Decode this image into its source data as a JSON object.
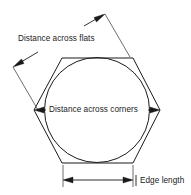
{
  "diagram": {
    "canvas": {
      "width": 191,
      "height": 195,
      "background": "#ffffff"
    },
    "stroke_color": "#1a1a1a",
    "extension_line_color": "#4a4a4a",
    "labels": {
      "distance_across_flats": "Distance across flats",
      "distance_across_corners": "Distance across corners",
      "edge_length": "Edge length"
    },
    "shapes": {
      "hexagon": {
        "name": "hexagon-outline",
        "orientation": "flat-top",
        "center": [
          97,
          110
        ],
        "circumradius": 63,
        "points": "62,58 133,58 160,110 133,163 62,163 34,110"
      },
      "circle": {
        "name": "chamfer-circle",
        "center": [
          97,
          110
        ],
        "radius": 52.5
      }
    },
    "dimensions": [
      {
        "name": "across-flats-dimension",
        "label": "Distance across flats",
        "orientation": "diagonal",
        "start": [
          13,
          67
        ],
        "end": [
          105,
          14
        ]
      },
      {
        "name": "across-corners-dimension",
        "label": "Distance across corners",
        "orientation": "horizontal",
        "start": [
          34,
          110
        ],
        "end": [
          160,
          110
        ]
      },
      {
        "name": "edge-length-dimension",
        "label": "Edge length",
        "orientation": "horizontal",
        "start": [
          63,
          180
        ],
        "end": [
          133,
          180
        ]
      }
    ]
  }
}
